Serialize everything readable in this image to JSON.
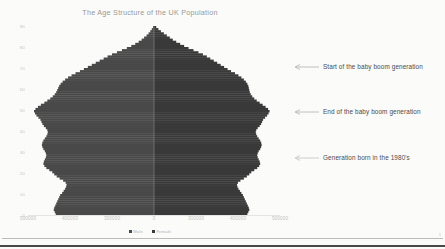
{
  "slide": {
    "background_color": "#fdfdfc",
    "bottom_rule_color": "#4a4a4a",
    "page_marker": "1"
  },
  "chart_data": {
    "type": "bar",
    "subtype": "population-pyramid",
    "title": "The Age Structure of the UK Population",
    "xlabel": "",
    "ylabel": "",
    "orientation": "horizontal-mirrored",
    "grid": false,
    "legend_position": "bottom-center",
    "center_value": 0,
    "xlim": [
      -500000,
      500000
    ],
    "x_tick_labels": [
      "500000",
      "400000",
      "300000",
      "200000",
      "0",
      "200000",
      "300000",
      "400000",
      "500000"
    ],
    "x_ticks_shown": [
      "500000",
      "400000",
      "300000",
      "0",
      "300000",
      "400000",
      "500000"
    ],
    "ylim": [
      0,
      90
    ],
    "y_tick_labels": [
      "90",
      "80",
      "70",
      "60",
      "50",
      "40",
      "30",
      "20",
      "10",
      "0"
    ],
    "categories": [
      "0",
      "1",
      "2",
      "3",
      "4",
      "5",
      "6",
      "7",
      "8",
      "9",
      "10",
      "11",
      "12",
      "13",
      "14",
      "15",
      "16",
      "17",
      "18",
      "19",
      "20",
      "21",
      "22",
      "23",
      "24",
      "25",
      "26",
      "27",
      "28",
      "29",
      "30",
      "31",
      "32",
      "33",
      "34",
      "35",
      "36",
      "37",
      "38",
      "39",
      "40",
      "41",
      "42",
      "43",
      "44",
      "45",
      "46",
      "47",
      "48",
      "49",
      "50",
      "51",
      "52",
      "53",
      "54",
      "55",
      "56",
      "57",
      "58",
      "59",
      "60",
      "61",
      "62",
      "63",
      "64",
      "65",
      "66",
      "67",
      "68",
      "69",
      "70",
      "71",
      "72",
      "73",
      "74",
      "75",
      "76",
      "77",
      "78",
      "79",
      "80",
      "81",
      "82",
      "83",
      "84",
      "85",
      "86",
      "87",
      "88",
      "89"
    ],
    "series": [
      {
        "name": "Male",
        "color": "#4a4a4a",
        "side": "left",
        "values": [
          398000,
          402000,
          406000,
          404000,
          400000,
          396000,
          392000,
          388000,
          384000,
          380000,
          372000,
          366000,
          360000,
          356000,
          354000,
          358000,
          368000,
          382000,
          394000,
          404000,
          412000,
          424000,
          436000,
          444000,
          448000,
          446000,
          442000,
          438000,
          436000,
          438000,
          442000,
          448000,
          452000,
          454000,
          452000,
          448000,
          442000,
          436000,
          432000,
          430000,
          432000,
          438000,
          446000,
          452000,
          456000,
          460000,
          468000,
          476000,
          482000,
          486000,
          480000,
          470000,
          458000,
          444000,
          432000,
          420000,
          410000,
          402000,
          396000,
          392000,
          388000,
          384000,
          378000,
          370000,
          360000,
          348000,
          334000,
          318000,
          300000,
          284000,
          268000,
          252000,
          236000,
          220000,
          204000,
          188000,
          170000,
          150000,
          130000,
          110000,
          92000,
          76000,
          62000,
          50000,
          40000,
          30000,
          22000,
          15000,
          9000,
          4000
        ]
      },
      {
        "name": "Female",
        "color": "#3a3a3a",
        "side": "right",
        "values": [
          378000,
          382000,
          386000,
          384000,
          380000,
          376000,
          372000,
          368000,
          364000,
          360000,
          354000,
          348000,
          342000,
          338000,
          336000,
          340000,
          350000,
          364000,
          376000,
          386000,
          394000,
          406000,
          418000,
          426000,
          430000,
          428000,
          424000,
          420000,
          418000,
          420000,
          424000,
          430000,
          434000,
          436000,
          434000,
          430000,
          424000,
          418000,
          414000,
          412000,
          414000,
          420000,
          428000,
          434000,
          438000,
          442000,
          450000,
          458000,
          464000,
          468000,
          462000,
          452000,
          440000,
          428000,
          416000,
          406000,
          398000,
          392000,
          388000,
          386000,
          384000,
          382000,
          378000,
          372000,
          364000,
          354000,
          342000,
          328000,
          312000,
          298000,
          284000,
          270000,
          256000,
          242000,
          228000,
          214000,
          198000,
          180000,
          160000,
          140000,
          122000,
          106000,
          90000,
          76000,
          64000,
          52000,
          40000,
          28000,
          18000,
          9000
        ]
      }
    ],
    "annotations": [
      {
        "id": "annotation-1",
        "text": "Start of the baby boom generation",
        "points_to_age": 65,
        "arrow": "left"
      },
      {
        "id": "annotation-2",
        "text": "End of the baby boom generation",
        "points_to_age": 48,
        "arrow": "left"
      },
      {
        "id": "annotation-3",
        "text": "Generation born in the 1980's",
        "points_to_age": 30,
        "arrow": "left"
      }
    ]
  },
  "legend": {
    "items": [
      {
        "label": "Male",
        "color": "#4a4a4a"
      },
      {
        "label": "Female",
        "color": "#3a3a3a"
      }
    ]
  }
}
